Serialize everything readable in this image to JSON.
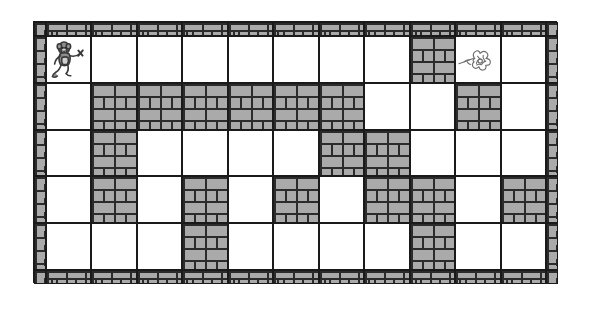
{
  "figure": {
    "name": "brick-maze-puzzle",
    "kind": "maze",
    "alt": "Rectangular brick-walled maze with a monkey at the top-left entrance and a flower at the top-right goal"
  },
  "maze": {
    "columns": 11,
    "rows": 5,
    "wall_color": "#aaaaaa",
    "mortar_color": "#2b2b2b",
    "outline_color": "#1a1a1a",
    "path_color": "#ffffff",
    "legend": {
      "start_label": "monkey",
      "goal_label": "flower"
    },
    "start": {
      "row": 0,
      "col": 0,
      "icon": "monkey-icon"
    },
    "goal": {
      "row": 0,
      "col": 9,
      "icon": "flower-icon"
    },
    "grid": [
      [
        "open",
        "open",
        "open",
        "open",
        "open",
        "open",
        "open",
        "open",
        "wall",
        "open",
        "open"
      ],
      [
        "open",
        "wall",
        "wall",
        "wall",
        "wall",
        "wall",
        "wall",
        "open",
        "open",
        "wall",
        "open"
      ],
      [
        "open",
        "wall",
        "open",
        "open",
        "open",
        "open",
        "wall",
        "wall",
        "open",
        "open",
        "open"
      ],
      [
        "open",
        "wall",
        "open",
        "wall",
        "open",
        "wall",
        "open",
        "wall",
        "wall",
        "open",
        "wall"
      ],
      [
        "open",
        "open",
        "open",
        "wall",
        "open",
        "open",
        "open",
        "open",
        "wall",
        "open",
        "open"
      ]
    ]
  }
}
